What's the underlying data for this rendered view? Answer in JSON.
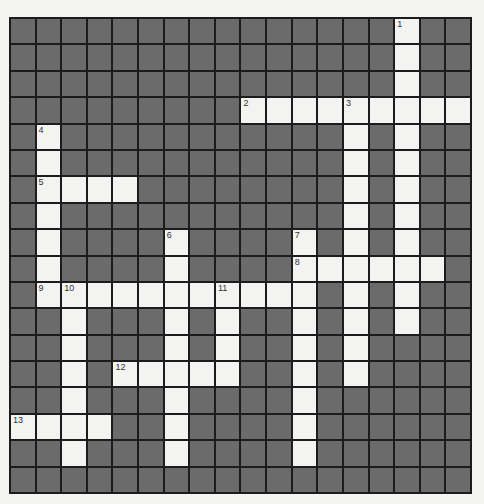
{
  "puzzle": {
    "rows": 18,
    "cols": 18,
    "colors": {
      "block": "#6b6b6b",
      "open": "#f3f3f1",
      "line": "#1c1c1c",
      "background": "#f4f4f1"
    },
    "entries": [
      {
        "number": "1",
        "direction": "down",
        "row": 0,
        "col": 15,
        "length": 12
      },
      {
        "number": "2",
        "direction": "across",
        "row": 3,
        "col": 9,
        "length": 9
      },
      {
        "number": "3",
        "direction": "down",
        "row": 3,
        "col": 13,
        "length": 11
      },
      {
        "number": "4",
        "direction": "down",
        "row": 4,
        "col": 1,
        "length": 7
      },
      {
        "number": "5",
        "direction": "across",
        "row": 6,
        "col": 1,
        "length": 4
      },
      {
        "number": "6",
        "direction": "down",
        "row": 8,
        "col": 6,
        "length": 9
      },
      {
        "number": "7",
        "direction": "down",
        "row": 8,
        "col": 11,
        "length": 9
      },
      {
        "number": "8",
        "direction": "across",
        "row": 9,
        "col": 11,
        "length": 6
      },
      {
        "number": "9",
        "direction": "across",
        "row": 10,
        "col": 1,
        "length": 11
      },
      {
        "number": "10",
        "direction": "down",
        "row": 10,
        "col": 2,
        "length": 7
      },
      {
        "number": "11",
        "direction": "down",
        "row": 10,
        "col": 8,
        "length": 4
      },
      {
        "number": "12",
        "direction": "across",
        "row": 13,
        "col": 4,
        "length": 5
      },
      {
        "number": "13",
        "direction": "across",
        "row": 15,
        "col": 0,
        "length": 4
      }
    ]
  }
}
